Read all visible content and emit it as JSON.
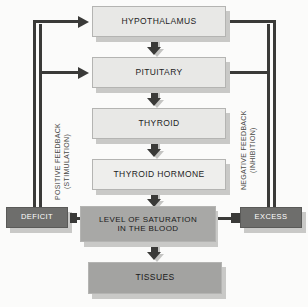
{
  "diagram": {
    "background": "#fbfbfa",
    "nodes": {
      "hypothalamus": "HYPOTHALAMUS",
      "pituitary": "PITUITARY",
      "thyroid": "THYROID",
      "thyroid_hormone": "THYROID HORMONE",
      "saturation_line1": "LEVEL OF SATURATION",
      "saturation_line2": "IN THE BLOOD",
      "tissues": "TISSUES",
      "deficit": "DEFICIT",
      "excess": "EXCESS"
    },
    "labels": {
      "positive_line1": "POSITIVE FEEDBACK",
      "positive_line2": "(STIMULATION)",
      "negative_line1": "NEGATIVE FEEDBACK",
      "negative_line2": "(INHIBITION)"
    },
    "colors": {
      "box_light": "#e8e8e6",
      "box_mid": "#a8a8a6",
      "box_dark": "#6e6e6c",
      "line": "#3a3a38",
      "shadow": "#c9c9c7",
      "text_dark": "#1d1d1d",
      "text_light": "#ffffff"
    },
    "flow": [
      "HYPOTHALAMUS",
      "PITUITARY",
      "THYROID",
      "THYROID HORMONE",
      "LEVEL OF SATURATION IN THE BLOOD",
      "TISSUES"
    ],
    "feedback": {
      "positive": {
        "source": "DEFICIT",
        "targets": [
          "HYPOTHALAMUS",
          "PITUITARY"
        ],
        "effect": "STIMULATION"
      },
      "negative": {
        "source": "EXCESS",
        "targets": [
          "HYPOTHALAMUS",
          "PITUITARY"
        ],
        "effect": "INHIBITION"
      }
    }
  }
}
